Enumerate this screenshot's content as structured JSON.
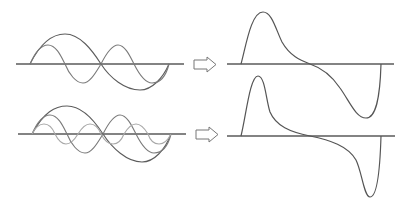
{
  "diagram": {
    "colors": {
      "axis": "#5a5a5a",
      "fundamental": "#5c5c5c",
      "second_harmonic": "#7a7a7a",
      "third_harmonic": "#a8a8a8",
      "result": "#555555",
      "arrow_stroke": "#777777",
      "background": "#ffffff"
    },
    "rows": [
      {
        "name": "row-two-harmonics",
        "components": [
          "fundamental",
          "second_harmonic"
        ],
        "arrow_icon": "right-outline-arrow-icon",
        "result": "skewed-wave-sum-of-two"
      },
      {
        "name": "row-three-harmonics",
        "components": [
          "fundamental",
          "second_harmonic",
          "third_harmonic"
        ],
        "arrow_icon": "right-outline-arrow-icon",
        "result": "skewed-wave-sum-of-three"
      }
    ]
  }
}
